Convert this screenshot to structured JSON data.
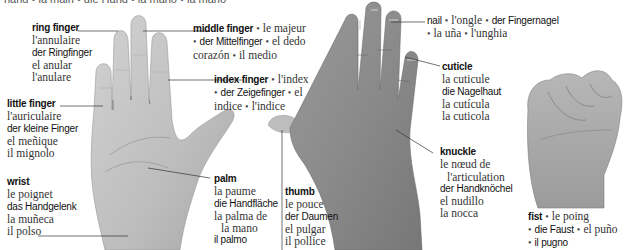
{
  "header": {
    "text": "hand • la main • die Hand • la mano • la mano"
  },
  "labels": {
    "ring_finger": {
      "en": "ring finger",
      "fr": "l'annulaire",
      "de": "der Ringfinger",
      "es": "el anular",
      "it": "l'anulare"
    },
    "little_finger": {
      "en": "little finger",
      "fr": "l'auriculaire",
      "de": "der kleine Finger",
      "es": "el meñique",
      "it": "il mignolo"
    },
    "wrist": {
      "en": "wrist",
      "fr": "le poignet",
      "de": "das Handgelenk",
      "es": "la muñeca",
      "it": "il polso"
    },
    "middle_finger": {
      "en": "middle finger",
      "fr": "le majeur",
      "de": "der Mittelfinger",
      "es_1": "el dedo",
      "es_2": "corazón",
      "it": "il medio"
    },
    "index_finger": {
      "en": "index finger",
      "fr": "l'index",
      "de": "der Zeigefinger",
      "es_1": "el",
      "es_2": "indice",
      "it": "l'indice"
    },
    "palm": {
      "en": "palm",
      "fr": "la paume",
      "de": "die Handfläche",
      "es_1": "la palma de",
      "es_2": "la mano",
      "it": "il palmo"
    },
    "thumb": {
      "en": "thumb",
      "fr": "le pouce",
      "de": "der Daumen",
      "es": "el pulgar",
      "it": "il pollice"
    },
    "nail": {
      "en": "nail",
      "fr": "l'ongle",
      "de": "der Fingernagel",
      "es": "la uña",
      "it": "l'unghia"
    },
    "cuticle": {
      "en": "cuticle",
      "fr": "la cuticule",
      "de": "die Nagelhaut",
      "es": "la cutícula",
      "it": "la cuticola"
    },
    "knuckle": {
      "en": "knuckle",
      "fr_1": "le nœud de",
      "fr_2": "l'articulation",
      "de": "der Handknöchel",
      "es": "el nudillo",
      "it": "la nocca"
    },
    "fist": {
      "en": "fist",
      "fr": "le poing",
      "de": "die Faust",
      "es": "el puño",
      "it": "il pugno"
    }
  },
  "separator": "•",
  "colors": {
    "skin_light": "#c9c9c9",
    "skin_mid": "#a9a9a9",
    "skin_dark": "#7d7d7d",
    "leader": "#333333",
    "text": "#222222"
  }
}
